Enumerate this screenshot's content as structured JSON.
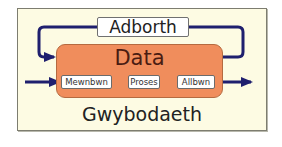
{
  "diagram": {
    "feedback_label": "Adborth",
    "box_label": "Data",
    "steps": [
      {
        "label": "Mewnbwn"
      },
      {
        "label": "Proses"
      },
      {
        "label": "Allbwn"
      }
    ],
    "caption": "Gwybodaeth",
    "colors": {
      "panel_bg": "#fdfbe3",
      "data_box": "#f08d5c",
      "arrows": "#1f1f6e",
      "data_text": "#4a1c12"
    }
  }
}
